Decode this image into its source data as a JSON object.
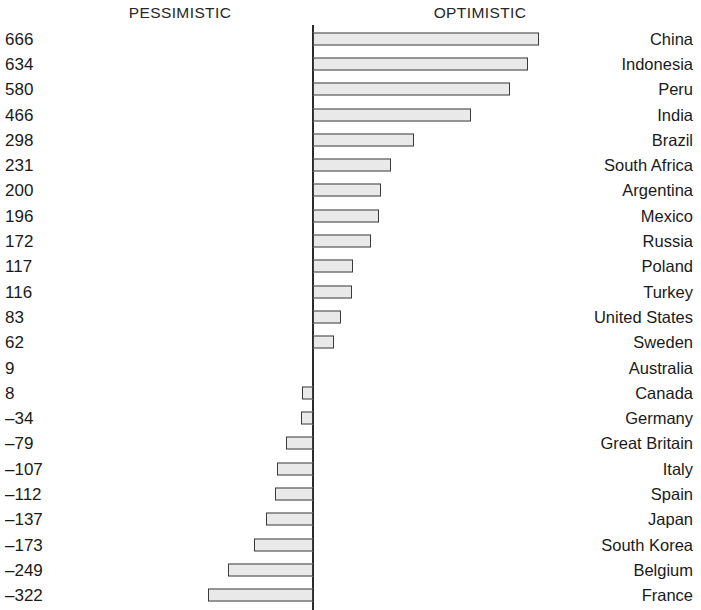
{
  "header": {
    "left_label": "PESSIMISTIC",
    "right_label": "OPTIMISTIC"
  },
  "style": {
    "bar_fill": "#e9e9e9",
    "bar_stroke": "#3a3a3a",
    "axis_color": "#2b2b2b",
    "text_color": "#1a1a1a",
    "background": "#ffffff"
  },
  "chart_data": {
    "type": "bar",
    "orientation": "horizontal",
    "title": "",
    "subtitle": "",
    "xlabel": "",
    "ylabel": "",
    "grid": false,
    "legend": "none",
    "axis_origin": 0,
    "negative_side_label": "PESSIMISTIC",
    "positive_side_label": "OPTIMISTIC",
    "xlim": [
      -350,
      700
    ],
    "categories": [
      "China",
      "Indonesia",
      "Peru",
      "India",
      "Brazil",
      "South Africa",
      "Argentina",
      "Mexico",
      "Russia",
      "Poland",
      "Turkey",
      "United States",
      "Sweden",
      "Australia",
      "Canada",
      "Germany",
      "Great Britain",
      "Italy",
      "Spain",
      "Japan",
      "South Korea",
      "Belgium",
      "France"
    ],
    "values": [
      666,
      634,
      580,
      466,
      298,
      231,
      200,
      196,
      172,
      117,
      116,
      83,
      62,
      9,
      8,
      -34,
      -79,
      -107,
      -112,
      -137,
      -173,
      -249,
      -322
    ],
    "value_labels": [
      "666",
      "634",
      "580",
      "466",
      "298",
      "231",
      "200",
      "196",
      "172",
      "117",
      "116",
      "83",
      "62",
      "9",
      "8",
      "–34",
      "–79",
      "–107",
      "–112",
      "–137",
      "–173",
      "–249",
      "–322"
    ],
    "rows": [
      {
        "country": "China",
        "value": 666,
        "value_label": "666",
        "bar_side": "right",
        "bar_px": 226
      },
      {
        "country": "Indonesia",
        "value": 634,
        "value_label": "634",
        "bar_side": "right",
        "bar_px": 215
      },
      {
        "country": "Peru",
        "value": 580,
        "value_label": "580",
        "bar_side": "right",
        "bar_px": 197
      },
      {
        "country": "India",
        "value": 466,
        "value_label": "466",
        "bar_side": "right",
        "bar_px": 158
      },
      {
        "country": "Brazil",
        "value": 298,
        "value_label": "298",
        "bar_side": "right",
        "bar_px": 101
      },
      {
        "country": "South Africa",
        "value": 231,
        "value_label": "231",
        "bar_side": "right",
        "bar_px": 78
      },
      {
        "country": "Argentina",
        "value": 200,
        "value_label": "200",
        "bar_side": "right",
        "bar_px": 68
      },
      {
        "country": "Mexico",
        "value": 196,
        "value_label": "196",
        "bar_side": "right",
        "bar_px": 66
      },
      {
        "country": "Russia",
        "value": 172,
        "value_label": "172",
        "bar_side": "right",
        "bar_px": 58
      },
      {
        "country": "Poland",
        "value": 117,
        "value_label": "117",
        "bar_side": "right",
        "bar_px": 40
      },
      {
        "country": "Turkey",
        "value": 116,
        "value_label": "116",
        "bar_side": "right",
        "bar_px": 39
      },
      {
        "country": "United States",
        "value": 83,
        "value_label": "83",
        "bar_side": "right",
        "bar_px": 28
      },
      {
        "country": "Sweden",
        "value": 62,
        "value_label": "62",
        "bar_side": "right",
        "bar_px": 21
      },
      {
        "country": "Australia",
        "value": 9,
        "value_label": "9",
        "bar_side": "none",
        "bar_px": 0
      },
      {
        "country": "Canada",
        "value": 8,
        "value_label": "8",
        "bar_side": "left",
        "bar_px": 11
      },
      {
        "country": "Germany",
        "value": -34,
        "value_label": "–34",
        "bar_side": "left",
        "bar_px": 12
      },
      {
        "country": "Great Britain",
        "value": -79,
        "value_label": "–79",
        "bar_side": "left",
        "bar_px": 27
      },
      {
        "country": "Italy",
        "value": -107,
        "value_label": "–107",
        "bar_side": "left",
        "bar_px": 36
      },
      {
        "country": "Spain",
        "value": -112,
        "value_label": "–112",
        "bar_side": "left",
        "bar_px": 38
      },
      {
        "country": "Japan",
        "value": -137,
        "value_label": "–137",
        "bar_side": "left",
        "bar_px": 47
      },
      {
        "country": "South Korea",
        "value": -173,
        "value_label": "–173",
        "bar_side": "left",
        "bar_px": 59
      },
      {
        "country": "Belgium",
        "value": -249,
        "value_label": "–249",
        "bar_side": "left",
        "bar_px": 85
      },
      {
        "country": "France",
        "value": -322,
        "value_label": "–322",
        "bar_side": "left",
        "bar_px": 105
      }
    ]
  }
}
